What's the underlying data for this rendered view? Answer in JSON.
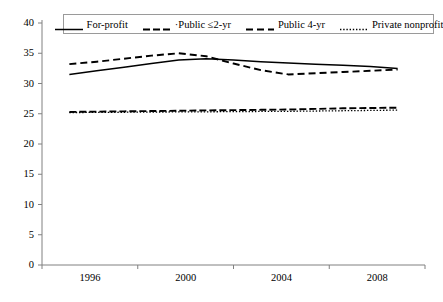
{
  "chart_data": {
    "type": "line",
    "title": "",
    "xlabel": "",
    "ylabel": "",
    "xlim": [
      1995,
      2009
    ],
    "ylim": [
      0,
      40
    ],
    "ytick_values": [
      0,
      5,
      10,
      15,
      20,
      25,
      30,
      35,
      40
    ],
    "ytick_labels": [
      "0",
      "5",
      "10",
      "15",
      "20",
      "25",
      "30",
      "35",
      "40"
    ],
    "xtick_labels": [
      "1996",
      "2000",
      "2004",
      "2008"
    ],
    "xtick_values": [
      1996,
      2000,
      2004,
      2008
    ],
    "grid": false,
    "legend_position": "top-center",
    "x": [
      1996,
      1997,
      1998,
      1999,
      2000,
      2001,
      2002,
      2003,
      2004,
      2005,
      2006,
      2007,
      2008
    ],
    "series": [
      {
        "name": "For-profit",
        "style": "solid",
        "color": "#000000",
        "values": [
          31.5,
          32.1,
          32.7,
          33.3,
          33.9,
          34.1,
          33.9,
          33.6,
          33.4,
          33.2,
          33.0,
          32.8,
          32.5
        ]
      },
      {
        "name": "Public ≤2-yr",
        "style": "long-dash",
        "color": "#000000",
        "values": [
          25.3,
          25.35,
          25.4,
          25.45,
          25.5,
          25.55,
          25.6,
          25.65,
          25.7,
          25.8,
          25.9,
          25.95,
          26.0
        ]
      },
      {
        "name": "Public 4-yr",
        "style": "dashed",
        "color": "#000000",
        "values": [
          33.2,
          33.6,
          34.1,
          34.6,
          35.0,
          34.5,
          33.3,
          32.2,
          31.5,
          31.7,
          31.9,
          32.1,
          32.3
        ]
      },
      {
        "name": "Private nonprofit",
        "style": "dotted",
        "color": "#000000",
        "values": [
          25.2,
          25.22,
          25.25,
          25.28,
          25.3,
          25.32,
          25.35,
          25.38,
          25.4,
          25.45,
          25.5,
          25.55,
          25.6
        ]
      }
    ]
  },
  "legend": {
    "items": [
      {
        "label": "For-profit",
        "style": "solid"
      },
      {
        "label": "·Public ≤2-yr",
        "style": "long-dash"
      },
      {
        "label": "Public 4-yr",
        "style": "dashed"
      },
      {
        "label": "Private nonprofit",
        "style": "dotted"
      }
    ]
  }
}
